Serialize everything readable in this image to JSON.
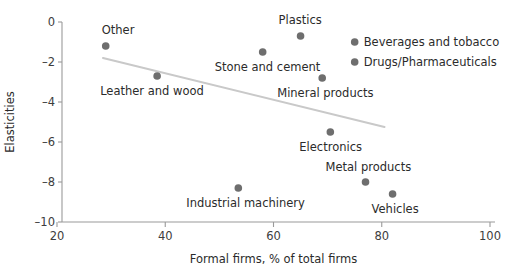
{
  "chart_data": {
    "type": "scatter",
    "title": "",
    "xlabel": "Formal firms, % of total firms",
    "ylabel": "Elasticities",
    "xlim": [
      20,
      100
    ],
    "ylim": [
      -10,
      0
    ],
    "xticks": [
      "20",
      "40",
      "60",
      "80",
      "100"
    ],
    "xtick_values": [
      20,
      40,
      60,
      80,
      100
    ],
    "yticks": [
      "0",
      "–2",
      "–4",
      "–6",
      "–8",
      "–10"
    ],
    "ytick_values": [
      0,
      -2,
      -4,
      -6,
      -8,
      -10
    ],
    "grid": false,
    "legend": "none",
    "marker_color": "#6e6e6e",
    "trendline_color": "#c9c9c9",
    "trendline": {
      "x_start": 28.5,
      "y_start": -1.8,
      "x_end": 80.5,
      "y_end": -5.25
    },
    "points": [
      {
        "label": "Other",
        "x": 29.0,
        "y": -1.2,
        "label_dx": -4,
        "label_dy": -12,
        "label_anchor": "start"
      },
      {
        "label": "Leather and wood",
        "x": 38.5,
        "y": -2.7,
        "label_dx": -57,
        "label_dy": 19,
        "label_anchor": "start"
      },
      {
        "label": "Industrial machinery",
        "x": 53.5,
        "y": -8.3,
        "label_dx": -52,
        "label_dy": 19,
        "label_anchor": "start"
      },
      {
        "label": "Stone and cement",
        "x": 58.0,
        "y": -1.5,
        "label_dx": -48,
        "label_dy": 19,
        "label_anchor": "start"
      },
      {
        "label": "Plastics",
        "x": 65.0,
        "y": -0.7,
        "label_dx": -22,
        "label_dy": -12,
        "label_anchor": "start"
      },
      {
        "label": "Mineral products",
        "x": 69.0,
        "y": -2.8,
        "label_dx": -45,
        "label_dy": 19,
        "label_anchor": "start"
      },
      {
        "label": "Electronics",
        "x": 70.5,
        "y": -5.5,
        "label_dx": -31,
        "label_dy": 19,
        "label_anchor": "start"
      },
      {
        "label": "Beverages and tobacco",
        "x": 75.0,
        "y": -1.0,
        "label_dx": 9,
        "label_dy": 4,
        "label_anchor": "start"
      },
      {
        "label": "Drugs/Pharmaceuticals",
        "x": 75.0,
        "y": -2.0,
        "label_dx": 9,
        "label_dy": 4,
        "label_anchor": "start"
      },
      {
        "label": "Metal products",
        "x": 77.0,
        "y": -8.0,
        "label_dx": -40,
        "label_dy": -11,
        "label_anchor": "start"
      },
      {
        "label": "Vehicles",
        "x": 82.0,
        "y": -8.6,
        "label_dx": -21,
        "label_dy": 19,
        "label_anchor": "start"
      }
    ]
  }
}
